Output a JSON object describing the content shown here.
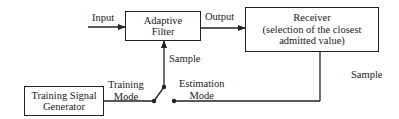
{
  "diagram": {
    "blocks": {
      "adaptive_filter": {
        "line1": "Adaptive",
        "line2": "Filter"
      },
      "receiver": {
        "line1": "Receiver",
        "line2": "(selection of the closest",
        "line3": "admitted value)"
      },
      "training_generator": {
        "line1": "Training Signal",
        "line2": "Generator"
      }
    },
    "labels": {
      "input": "Input",
      "output": "Output",
      "sample_center": "Sample",
      "sample_right": "Sample",
      "training_mode_line1": "Training",
      "training_mode_line2": "Mode",
      "estimation_mode_line1": "Estimation",
      "estimation_mode_line2": "Mode"
    },
    "colors": {
      "line": "#222222",
      "background": "#ffffff"
    }
  }
}
